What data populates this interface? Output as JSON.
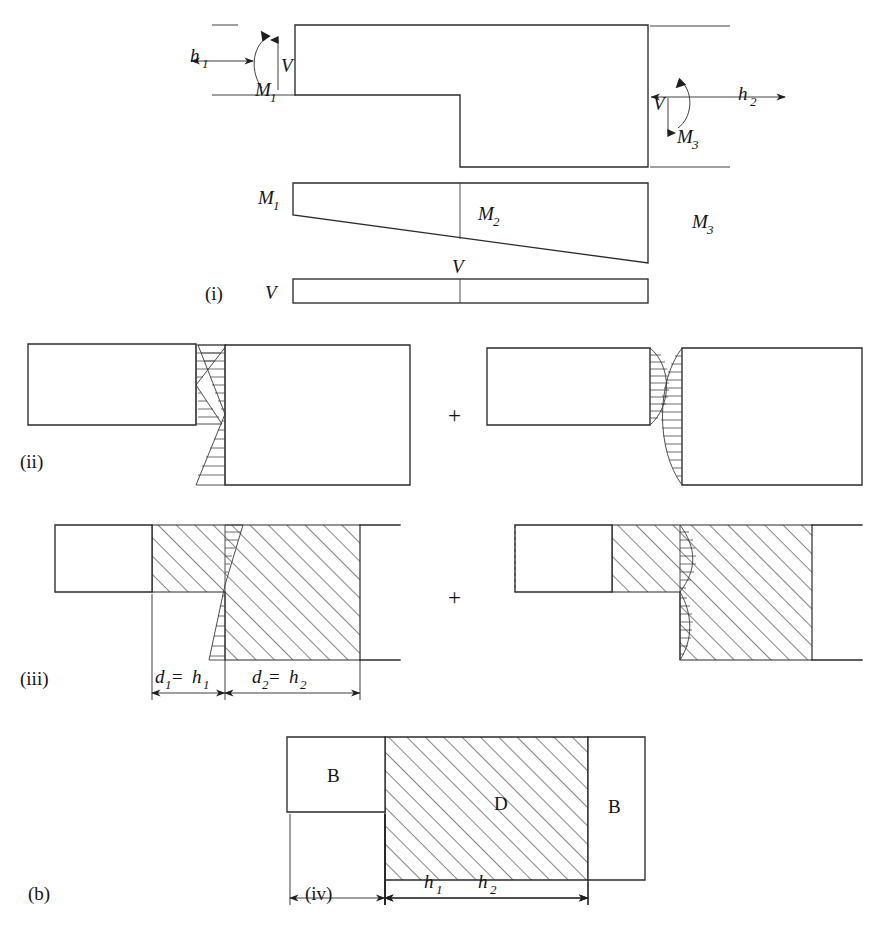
{
  "figure": {
    "caption_label": "(b)",
    "panels": [
      {
        "id": "i",
        "label": "(i)"
      },
      {
        "id": "ii",
        "label": "(ii)"
      },
      {
        "id": "iii",
        "label": "(iii)"
      },
      {
        "id": "iv",
        "label": "(iv)"
      }
    ],
    "operators": {
      "plus_ii": "+",
      "plus_iii": "+"
    },
    "panel_i": {
      "height_label_1": "h",
      "height_sub_1": "1",
      "height_label_2": "h",
      "height_sub_2": "2",
      "shear_left": "V",
      "shear_right": "V",
      "moment_left": "M",
      "moment_left_sub": "1",
      "moment_mid": "M",
      "moment_mid_sub": "2",
      "moment_right": "M",
      "moment_right_sub": "3",
      "moment_diagram_left": "M",
      "moment_diagram_left_sub": "1",
      "moment_diagram_mid": "M",
      "moment_diagram_mid_sub": "2",
      "moment_diagram_right": "M",
      "moment_diagram_right_sub": "3",
      "shear_diagram_top": "V",
      "shear_diagram_left": "V"
    },
    "panel_iii": {
      "dim_left_d": "d",
      "dim_left_d_sub": "1",
      "dim_left_eq": " = ",
      "dim_left_h": "h",
      "dim_left_h_sub": "1",
      "dim_right_d": "d",
      "dim_right_d_sub": "2",
      "dim_right_eq": " = ",
      "dim_right_h": "h",
      "dim_right_h_sub": "2"
    },
    "panel_iv": {
      "region_b_left": "B",
      "region_d": "D",
      "region_b_right": "B",
      "dim_h1": "h",
      "dim_h1_sub": "1",
      "dim_h2": "h",
      "dim_h2_sub": "2"
    },
    "colors": {
      "line": "#2b2b2b",
      "hatch": "#3d3d3d",
      "background": "#ffffff",
      "text": "#141414"
    }
  }
}
